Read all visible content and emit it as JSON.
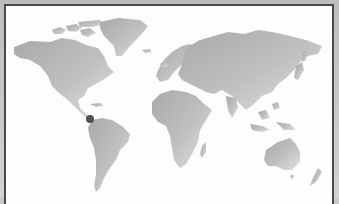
{
  "map": {
    "type": "world-map",
    "land_color": "#b4b4b4",
    "land_highlight": "#dadada",
    "background_color": "#fdfdfd",
    "frame_color": "#4a4a4a",
    "markers": [
      {
        "name": "location-marker",
        "x": 90,
        "y": 119,
        "r": 4,
        "color": "#505050"
      }
    ]
  }
}
